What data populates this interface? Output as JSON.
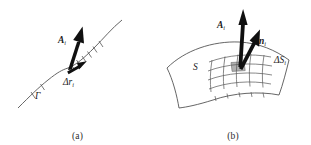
{
  "figure": {
    "background_color": "#ffffff",
    "ink_color": "#1a1a1a",
    "curve_color": "#555555",
    "patch_fill_color": "#b0b0b0"
  },
  "panel_a": {
    "caption": "(a)",
    "curve_label": "Γ",
    "vector_label": "A",
    "vector_subscript": "i",
    "segment_label": "Δr",
    "segment_subscript": "i",
    "description": "curve-with-tangent-vector"
  },
  "panel_b": {
    "caption": "(b)",
    "surface_label": "S",
    "vector_label": "A",
    "vector_subscript": "i",
    "normal_label": "n",
    "normal_subscript": "i",
    "patch_label": "ΔS",
    "patch_subscript": "i",
    "description": "surface-with-normal-vector"
  }
}
